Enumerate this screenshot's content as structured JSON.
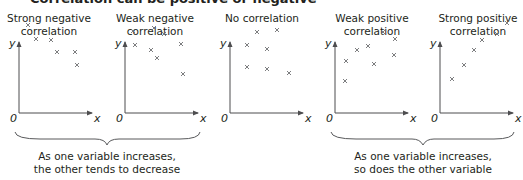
{
  "header": {
    "title_cut": "Correlation can be positive or negative"
  },
  "graphs": [
    {
      "title_line1": "Strong negative",
      "title_line2": "correlation",
      "type": "strong-negative",
      "points": [
        [
          9,
          88
        ],
        [
          17,
          74
        ],
        [
          32,
          73
        ],
        [
          38,
          61
        ],
        [
          56,
          61
        ],
        [
          58,
          48
        ]
      ]
    },
    {
      "title_line1": "Weak negative",
      "title_line2": "correlation",
      "type": "weak-negative",
      "points": [
        [
          8,
          82
        ],
        [
          10,
          68
        ],
        [
          29,
          85
        ],
        [
          39,
          79
        ],
        [
          26,
          63
        ],
        [
          56,
          69
        ],
        [
          32,
          55
        ],
        [
          58,
          39
        ]
      ]
    },
    {
      "title_line1": "No correlation",
      "title_line2": "",
      "type": "none",
      "points": [
        [
          27,
          81
        ],
        [
          47,
          83
        ],
        [
          17,
          68
        ],
        [
          37,
          64
        ],
        [
          17,
          46
        ],
        [
          37,
          44
        ],
        [
          59,
          40
        ]
      ]
    },
    {
      "title_line1": "Weak positive",
      "title_line2": "correlation",
      "type": "weak-positive",
      "points": [
        [
          11,
          52
        ],
        [
          22,
          63
        ],
        [
          33,
          67
        ],
        [
          48,
          81
        ],
        [
          60,
          74
        ],
        [
          59,
          58
        ],
        [
          39,
          49
        ],
        [
          10,
          32
        ]
      ]
    },
    {
      "title_line1": "Strong positive",
      "title_line2": "correlation",
      "type": "strong-positive",
      "points": [
        [
          12,
          34
        ],
        [
          24,
          48
        ],
        [
          34,
          63
        ],
        [
          42,
          73
        ],
        [
          57,
          79
        ],
        [
          67,
          90
        ]
      ]
    }
  ],
  "axes": {
    "y_label": "y",
    "x_label": "x",
    "origin_label": "0"
  },
  "captions": {
    "negative_line1": "As one variable increases,",
    "negative_line2": "the other tends to decrease",
    "positive_line1": "As one variable increases,",
    "positive_line2": "so does the other variable"
  },
  "colors": {
    "axis": "#4d4d4f",
    "marker": "#6d6e71",
    "text": "#231f20",
    "brace": "#58595b"
  }
}
